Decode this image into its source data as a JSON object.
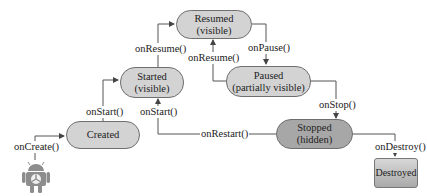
{
  "states": {
    "resumed": {
      "name": "Resumed",
      "sub": "(visible)"
    },
    "started": {
      "name": "Started",
      "sub": "(visible)"
    },
    "paused": {
      "name": "Paused",
      "sub": "(partially visible)"
    },
    "created": {
      "name": "Created"
    },
    "stopped": {
      "name": "Stopped",
      "sub": "(hidden)"
    },
    "destroyed": {
      "name": "Destroyed"
    }
  },
  "transitions": {
    "on_create": "onCreate()",
    "on_start_created": "onStart()",
    "on_start_restart": "onStart()",
    "on_resume_started": "onResume()",
    "on_resume_paused": "onResume()",
    "on_pause": "onPause()",
    "on_stop": "onStop()",
    "on_restart": "onRestart()",
    "on_destroy": "onDestroy()"
  },
  "colors": {
    "state_fill": "#d3d3d3",
    "stopped_fill": "#a7a7a7",
    "line": "#555555"
  },
  "icons": {
    "entry": "android-robot-icon"
  }
}
